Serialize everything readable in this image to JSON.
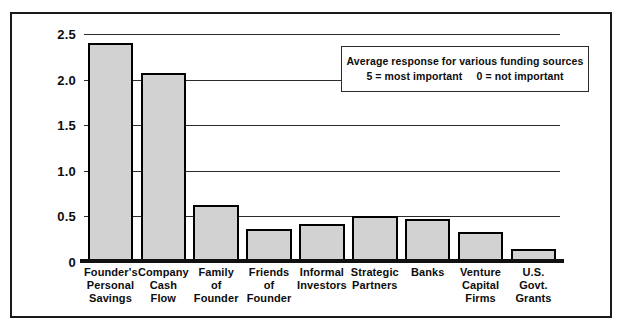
{
  "chart_data": {
    "type": "bar",
    "title": "",
    "subtitle": "",
    "xlabel": "",
    "ylabel": "",
    "ylim": [
      0,
      2.5
    ],
    "yticks": [
      "0",
      "0.5",
      "1.0",
      "1.5",
      "2.0",
      "2.5"
    ],
    "ytick_values": [
      0,
      0.5,
      1.0,
      1.5,
      2.0,
      2.5
    ],
    "grid": true,
    "legend_position": "inside-top-right",
    "categories": [
      "Founder's Personal Savings",
      "Company Cash Flow",
      "Family of Founder",
      "Friends of Founder",
      "Informal Investors",
      "Strategic Partners",
      "Banks",
      "Venture Capital Firms",
      "U.S. Govt. Grants"
    ],
    "category_lines": [
      [
        "Founder's",
        "Personal",
        "Savings"
      ],
      [
        "Company",
        "Cash",
        "Flow"
      ],
      [
        "Family",
        "of",
        "Founder"
      ],
      [
        "Friends",
        "of",
        "Founder"
      ],
      [
        "Informal",
        "Investors"
      ],
      [
        "Strategic",
        "Partners"
      ],
      [
        "Banks"
      ],
      [
        "Venture",
        "Capital",
        "Firms"
      ],
      [
        "U.S.",
        "Govt.",
        "Grants"
      ]
    ],
    "values": [
      2.4,
      2.07,
      0.63,
      0.36,
      0.42,
      0.51,
      0.47,
      0.33,
      0.14
    ],
    "annotation": {
      "line1": "Average response for various funding sources",
      "line2_left": "5 = most important",
      "line2_right": "0 = not important"
    },
    "colors": {
      "bar_fill": "#d2d2d2",
      "bar_edge": "#000000",
      "gridline": "#2b2b2b",
      "axis": "#111111",
      "text": "#0d0d0d",
      "frame": "#1a1a1a",
      "background": "#ffffff"
    }
  }
}
